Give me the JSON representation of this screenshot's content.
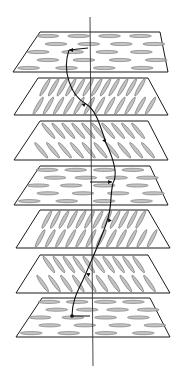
{
  "diagram": {
    "title": "",
    "colors": {
      "plane_stroke": "#1a1a1a",
      "molecule_fill": "#c4c4c4",
      "molecule_stroke": "#6e6e6e",
      "helix": "#111111",
      "axis": "#333333"
    },
    "layers": [
      {
        "id": "layer-1",
        "director_angle_deg": 0,
        "molecule_arrangement": "rows",
        "rows": 5,
        "cols": 4,
        "marker": "arrowhead"
      },
      {
        "id": "layer-2",
        "director_angle_deg": 60,
        "molecule_arrangement": "rows",
        "rows": 2,
        "cols": 14,
        "marker": "arrowhead"
      },
      {
        "id": "layer-3",
        "director_angle_deg": -50,
        "molecule_arrangement": "rows",
        "rows": 2,
        "cols": 12,
        "marker": "arrowhead"
      },
      {
        "id": "layer-4",
        "director_angle_deg": 0,
        "molecule_arrangement": "rows",
        "rows": 5,
        "cols": 4,
        "marker": "arrowhead"
      },
      {
        "id": "layer-5",
        "director_angle_deg": 62,
        "molecule_arrangement": "rows",
        "rows": 2,
        "cols": 14,
        "marker": "arrowhead"
      },
      {
        "id": "layer-6",
        "director_angle_deg": -55,
        "molecule_arrangement": "rows",
        "rows": 2,
        "cols": 12,
        "marker": "arrowhead"
      },
      {
        "id": "layer-7",
        "director_angle_deg": 0,
        "molecule_arrangement": "rows",
        "rows": 5,
        "cols": 4,
        "marker": "dot"
      }
    ],
    "axis": {
      "label": "",
      "orientation": "vertical"
    },
    "helix": {
      "label": "",
      "direction": "top-to-bottom"
    }
  }
}
